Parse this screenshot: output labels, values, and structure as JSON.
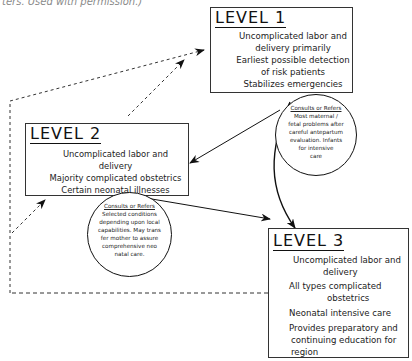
{
  "caption": "ters. Used with permission.)",
  "levels": [
    {
      "title": "LEVEL 1",
      "items": [
        "Uncomplicated labor and",
        "delivery primarily",
        "Earliest possible detection",
        "of risk patients",
        "Stabilizes emergencies"
      ],
      "consult": {
        "heading": "Consults or Refers",
        "lines": [
          "Most maternal /",
          "fetal problems after",
          "careful antepartum",
          "evaluation. Infants",
          "for intensive",
          "care"
        ]
      }
    },
    {
      "title": "LEVEL 2",
      "items": [
        "Uncomplicated labor and",
        "delivery",
        "Majority complicated obstetrics",
        "Certain neonatal illnesses"
      ],
      "consult": {
        "heading": "Consults or Refers",
        "lines": [
          "Selected conditions",
          "depending upon local",
          "capabilities. May trans",
          "fer mother to assure",
          "comprehensive neo",
          "natal care."
        ]
      }
    },
    {
      "title": "LEVEL 3",
      "items": [
        "Uncomplicated labor and",
        "delivery",
        "All types complicated",
        "obstetrics",
        "Neonatal intensive care",
        "Provides preparatory and",
        "continuing education for",
        "region"
      ]
    }
  ],
  "connections": [
    {
      "from": "LEVEL 1",
      "to": "LEVEL 2",
      "style": "solid",
      "label": "consults-or-refers"
    },
    {
      "from": "LEVEL 1",
      "to": "LEVEL 3",
      "style": "solid",
      "label": "consults-or-refers"
    },
    {
      "from": "LEVEL 2",
      "to": "LEVEL 3",
      "style": "solid",
      "label": "consults-or-refers"
    },
    {
      "from": "LEVEL 2",
      "to": "LEVEL 1",
      "style": "dashed"
    },
    {
      "from": "LEVEL 3",
      "to": "LEVEL 1",
      "style": "dashed"
    },
    {
      "from": "LEVEL 3",
      "to": "LEVEL 2",
      "style": "dashed"
    }
  ]
}
